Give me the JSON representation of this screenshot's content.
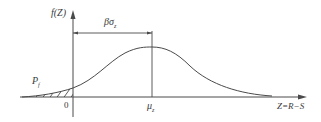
{
  "diagram": {
    "type": "probability-density-curve",
    "y_axis_label": "f(Z)",
    "x_axis_label": "Z=R−S",
    "origin_label": "0",
    "mean_label": "μ",
    "mean_subscript": "z",
    "dimension_label": "βσ",
    "dimension_subscript": "z",
    "failure_prob_label": "P",
    "failure_prob_subscript": "f",
    "colors": {
      "line": "#4a4a4a",
      "text": "#3a3a3a",
      "background": "#ffffff"
    }
  }
}
